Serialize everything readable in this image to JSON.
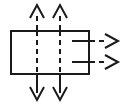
{
  "diagram": {
    "canvas": {
      "width": 128,
      "height": 105,
      "background": "#ffffff"
    },
    "stroke_color": "#1a1a1a",
    "stroke_width": 2,
    "box": {
      "label": "rectangle",
      "x": 10,
      "y": 30,
      "width": 80,
      "height": 45
    },
    "internal_vertical_lines": [
      {
        "label": "left-internal-dashed-line",
        "x": 37,
        "y1": 30,
        "y2": 75
      },
      {
        "label": "right-internal-dashed-line",
        "x": 60,
        "y1": 30,
        "y2": 75
      }
    ],
    "internal_horizontal_stubs": [
      {
        "label": "upper-stub",
        "x1": 72,
        "x2": 90,
        "y": 41
      },
      {
        "label": "lower-stub",
        "x1": 72,
        "x2": 90,
        "y": 62
      }
    ],
    "arrows": [
      {
        "name": "top-left-arrow",
        "direction": "up",
        "line": {
          "x1": 37,
          "y1": 30,
          "x2": 37,
          "y2": 12
        },
        "tip": {
          "x": 37,
          "y": 5
        },
        "head_half_width": 7,
        "head_length": 13
      },
      {
        "name": "top-right-arrow",
        "direction": "up",
        "line": {
          "x1": 60,
          "y1": 30,
          "x2": 60,
          "y2": 12
        },
        "tip": {
          "x": 60,
          "y": 5
        },
        "head_half_width": 7,
        "head_length": 13
      },
      {
        "name": "bottom-left-arrow",
        "direction": "down",
        "line": {
          "x1": 37,
          "y1": 75,
          "x2": 37,
          "y2": 93
        },
        "tip": {
          "x": 37,
          "y": 100
        },
        "head_half_width": 7,
        "head_length": 13
      },
      {
        "name": "bottom-right-arrow",
        "direction": "down",
        "line": {
          "x1": 60,
          "y1": 75,
          "x2": 60,
          "y2": 93
        },
        "tip": {
          "x": 60,
          "y": 100
        },
        "head_half_width": 7,
        "head_length": 13
      },
      {
        "name": "right-upper-arrow",
        "direction": "right",
        "line": {
          "x1": 90,
          "y1": 41,
          "x2": 108,
          "y2": 41
        },
        "tip": {
          "x": 118,
          "y": 41
        },
        "head_half_width": 7,
        "head_length": 13
      },
      {
        "name": "right-lower-arrow",
        "direction": "right",
        "line": {
          "x1": 90,
          "y1": 62,
          "x2": 108,
          "y2": 62
        },
        "tip": {
          "x": 118,
          "y": 62
        },
        "head_half_width": 7,
        "head_length": 13
      }
    ]
  }
}
